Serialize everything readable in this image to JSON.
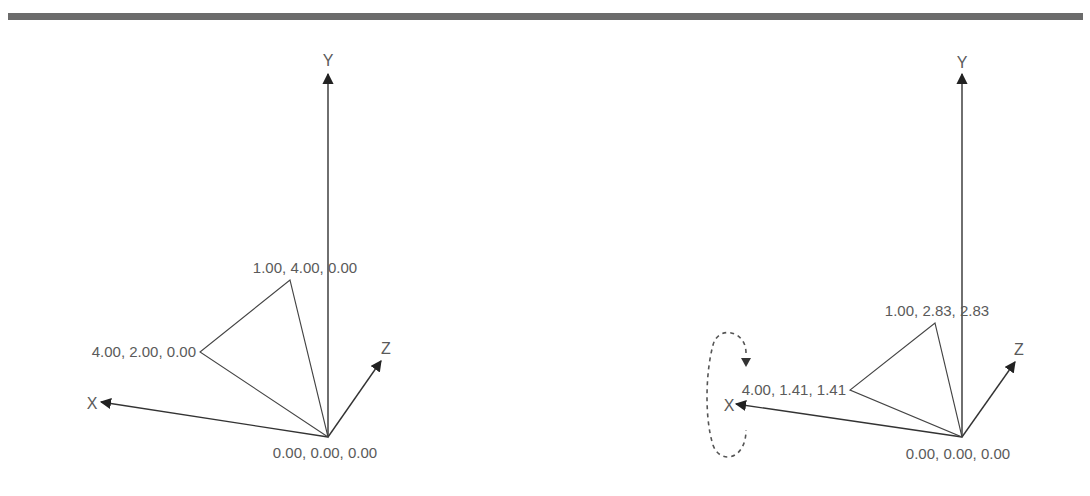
{
  "diagrams": [
    {
      "name": "original",
      "axes": {
        "x_label": "X",
        "y_label": "Y",
        "z_label": "Z"
      },
      "vertices": [
        {
          "label": "0.00, 0.00, 0.00",
          "coords": [
            0.0,
            0.0,
            0.0
          ]
        },
        {
          "label": "1.00, 4.00, 0.00",
          "coords": [
            1.0,
            4.0,
            0.0
          ]
        },
        {
          "label": "4.00, 2.00, 0.00",
          "coords": [
            4.0,
            2.0,
            0.0
          ]
        }
      ]
    },
    {
      "name": "rotated-about-x",
      "axes": {
        "x_label": "X",
        "y_label": "Y",
        "z_label": "Z"
      },
      "vertices": [
        {
          "label": "0.00, 0.00, 0.00",
          "coords": [
            0.0,
            0.0,
            0.0
          ]
        },
        {
          "label": "1.00, 2.83, 2.83",
          "coords": [
            1.0,
            2.83,
            2.83
          ]
        },
        {
          "label": "4.00, 1.41, 1.41",
          "coords": [
            4.0,
            1.41,
            1.41
          ]
        }
      ],
      "rotation_indicator": {
        "axis": "X",
        "style": "dashed-ellipse-arrow"
      }
    }
  ],
  "colors": {
    "rule": "#6b6b6b",
    "axis": "#333333",
    "text": "#5a5a5a"
  }
}
